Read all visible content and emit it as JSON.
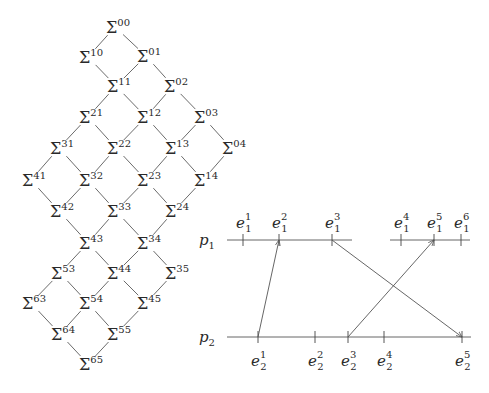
{
  "lattice": {
    "symbol": "Σ",
    "nodes": [
      {
        "id": "00",
        "x": 112,
        "y": 27
      },
      {
        "id": "10",
        "x": 85,
        "y": 57
      },
      {
        "id": "01",
        "x": 143,
        "y": 56
      },
      {
        "id": "11",
        "x": 113,
        "y": 86
      },
      {
        "id": "02",
        "x": 170,
        "y": 86
      },
      {
        "id": "21",
        "x": 85,
        "y": 117
      },
      {
        "id": "12",
        "x": 143,
        "y": 117
      },
      {
        "id": "03",
        "x": 200,
        "y": 117
      },
      {
        "id": "31",
        "x": 56,
        "y": 148
      },
      {
        "id": "22",
        "x": 113,
        "y": 148
      },
      {
        "id": "13",
        "x": 171,
        "y": 148
      },
      {
        "id": "04",
        "x": 228,
        "y": 148
      },
      {
        "id": "41",
        "x": 28,
        "y": 180
      },
      {
        "id": "32",
        "x": 85,
        "y": 180
      },
      {
        "id": "23",
        "x": 143,
        "y": 180
      },
      {
        "id": "14",
        "x": 200,
        "y": 180
      },
      {
        "id": "42",
        "x": 56,
        "y": 211
      },
      {
        "id": "33",
        "x": 113,
        "y": 211
      },
      {
        "id": "24",
        "x": 171,
        "y": 211
      },
      {
        "id": "43",
        "x": 85,
        "y": 243
      },
      {
        "id": "34",
        "x": 143,
        "y": 243
      },
      {
        "id": "53",
        "x": 57,
        "y": 273
      },
      {
        "id": "44",
        "x": 113,
        "y": 273
      },
      {
        "id": "35",
        "x": 171,
        "y": 273
      },
      {
        "id": "63",
        "x": 28,
        "y": 303
      },
      {
        "id": "54",
        "x": 85,
        "y": 303
      },
      {
        "id": "45",
        "x": 143,
        "y": 303
      },
      {
        "id": "64",
        "x": 57,
        "y": 334
      },
      {
        "id": "55",
        "x": 113,
        "y": 334
      },
      {
        "id": "65",
        "x": 85,
        "y": 364
      }
    ],
    "edges": [
      [
        "00",
        "10"
      ],
      [
        "00",
        "01"
      ],
      [
        "10",
        "11"
      ],
      [
        "01",
        "11"
      ],
      [
        "01",
        "02"
      ],
      [
        "11",
        "21"
      ],
      [
        "11",
        "12"
      ],
      [
        "02",
        "12"
      ],
      [
        "02",
        "03"
      ],
      [
        "21",
        "31"
      ],
      [
        "21",
        "22"
      ],
      [
        "12",
        "22"
      ],
      [
        "12",
        "13"
      ],
      [
        "03",
        "13"
      ],
      [
        "03",
        "04"
      ],
      [
        "31",
        "41"
      ],
      [
        "31",
        "32"
      ],
      [
        "22",
        "32"
      ],
      [
        "22",
        "23"
      ],
      [
        "13",
        "23"
      ],
      [
        "13",
        "14"
      ],
      [
        "04",
        "14"
      ],
      [
        "41",
        "42"
      ],
      [
        "32",
        "42"
      ],
      [
        "32",
        "33"
      ],
      [
        "23",
        "33"
      ],
      [
        "23",
        "24"
      ],
      [
        "14",
        "24"
      ],
      [
        "42",
        "43"
      ],
      [
        "33",
        "43"
      ],
      [
        "33",
        "34"
      ],
      [
        "24",
        "34"
      ],
      [
        "43",
        "53"
      ],
      [
        "43",
        "44"
      ],
      [
        "34",
        "44"
      ],
      [
        "34",
        "35"
      ],
      [
        "53",
        "63"
      ],
      [
        "53",
        "54"
      ],
      [
        "44",
        "54"
      ],
      [
        "44",
        "45"
      ],
      [
        "35",
        "45"
      ],
      [
        "63",
        "64"
      ],
      [
        "54",
        "64"
      ],
      [
        "54",
        "55"
      ],
      [
        "45",
        "55"
      ],
      [
        "64",
        "65"
      ],
      [
        "55",
        "65"
      ]
    ]
  },
  "timing": {
    "processes": [
      {
        "name": "p",
        "index": "1",
        "y": 240,
        "segments": [
          [
            227,
            352
          ],
          [
            390,
            470
          ]
        ],
        "events": [
          {
            "base": "e",
            "sub": "1",
            "sup": "1",
            "x": 243
          },
          {
            "base": "e",
            "sub": "1",
            "sup": "2",
            "x": 279
          },
          {
            "base": "e",
            "sub": "1",
            "sup": "3",
            "x": 332
          },
          {
            "base": "e",
            "sub": "1",
            "sup": "4",
            "x": 401
          },
          {
            "base": "e",
            "sub": "1",
            "sup": "5",
            "x": 434
          },
          {
            "base": "e",
            "sub": "1",
            "sup": "6",
            "x": 461
          }
        ]
      },
      {
        "name": "p",
        "index": "2",
        "y": 337,
        "segments": [
          [
            227,
            471
          ]
        ],
        "events": [
          {
            "base": "e",
            "sub": "2",
            "sup": "1",
            "x": 258
          },
          {
            "base": "e",
            "sub": "2",
            "sup": "2",
            "x": 315
          },
          {
            "base": "e",
            "sub": "2",
            "sup": "3",
            "x": 348
          },
          {
            "base": "e",
            "sub": "2",
            "sup": "4",
            "x": 384
          },
          {
            "base": "e",
            "sub": "2",
            "sup": "5",
            "x": 462
          }
        ]
      }
    ],
    "messages": [
      {
        "from": "e2^1",
        "to": "e1^2",
        "x1": 258,
        "y1": 337,
        "x2": 279,
        "y2": 240
      },
      {
        "from": "e1^3",
        "to": "e2^5",
        "x1": 332,
        "y1": 240,
        "x2": 462,
        "y2": 337
      },
      {
        "from": "e2^3",
        "to": "e1^5",
        "x1": 348,
        "y1": 337,
        "x2": 434,
        "y2": 240
      }
    ]
  }
}
